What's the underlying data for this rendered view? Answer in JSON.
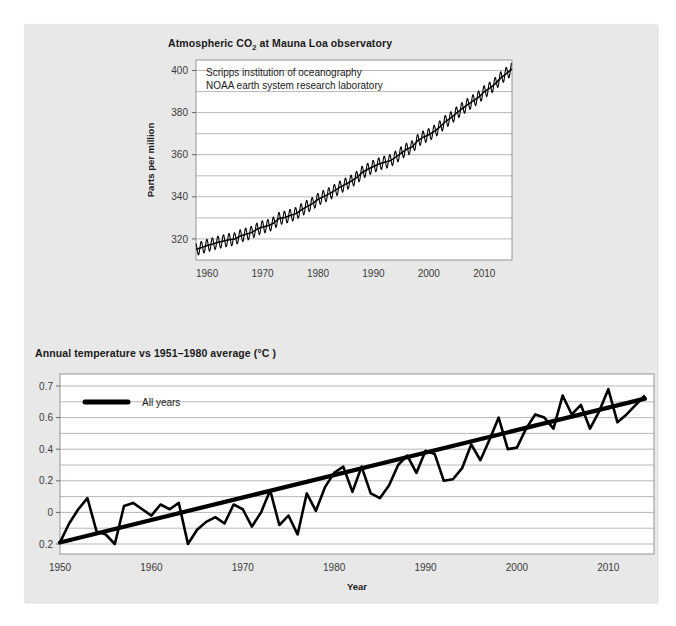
{
  "figure": {
    "background": "#e8e8e8",
    "panel_color": "#e8e8e8",
    "plot_color": "#ffffff",
    "line_color": "#000000",
    "grid_color": "#9a9a9a"
  },
  "chart_data": [
    {
      "id": "co2",
      "type": "line",
      "title": "Atmospheric CO₂ at Mauna Loa observatory",
      "title_plain": "Atmospheric CO2 at Mauna Loa observatory",
      "xlabel": "",
      "ylabel": "Parts per million",
      "annotations": [
        "Scripps institution of oceanography",
        "NOAA earth system research laboratory"
      ],
      "xlim": [
        1958,
        2015
      ],
      "ylim": [
        310,
        405
      ],
      "xticks": [
        1960,
        1970,
        1980,
        1990,
        2000,
        2010
      ],
      "xticklabels": [
        "1960",
        "1970",
        "1980",
        "1990",
        "2000",
        "2010"
      ],
      "yticks": [
        320,
        340,
        360,
        380,
        400
      ],
      "yticklabels": [
        "320",
        "340",
        "360",
        "380",
        "400"
      ],
      "minor_yticks": [
        330,
        350,
        370,
        390
      ],
      "grid": true,
      "legend": "none",
      "series": [
        {
          "name": "Monthly mean CO2",
          "note": "annual mean trend with seasonal sawtooth, amplitude about 3 ppm",
          "seasonal_amplitude_ppm": 3.0,
          "x": [
            1958,
            1959,
            1960,
            1961,
            1962,
            1963,
            1964,
            1965,
            1966,
            1967,
            1968,
            1969,
            1970,
            1971,
            1972,
            1973,
            1974,
            1975,
            1976,
            1977,
            1978,
            1979,
            1980,
            1981,
            1982,
            1983,
            1984,
            1985,
            1986,
            1987,
            1988,
            1989,
            1990,
            1991,
            1992,
            1993,
            1994,
            1995,
            1996,
            1997,
            1998,
            1999,
            2000,
            2001,
            2002,
            2003,
            2004,
            2005,
            2006,
            2007,
            2008,
            2009,
            2010,
            2011,
            2012,
            2013,
            2014,
            2015
          ],
          "values": [
            315.0,
            315.9,
            316.9,
            317.6,
            318.4,
            319.0,
            319.6,
            320.0,
            321.4,
            322.2,
            323.0,
            324.6,
            325.7,
            326.3,
            327.5,
            329.7,
            330.2,
            331.1,
            332.0,
            333.8,
            335.4,
            336.8,
            338.8,
            340.1,
            341.4,
            343.0,
            344.6,
            346.0,
            347.4,
            349.2,
            351.6,
            353.1,
            354.4,
            355.6,
            356.4,
            357.1,
            358.8,
            360.8,
            362.6,
            363.7,
            366.7,
            368.4,
            369.5,
            371.1,
            373.2,
            375.8,
            377.5,
            379.8,
            381.9,
            383.8,
            385.6,
            387.4,
            389.9,
            391.6,
            393.8,
            396.5,
            398.6,
            400.8
          ]
        }
      ]
    },
    {
      "id": "temperature",
      "type": "line",
      "title": "Annual temperature vs 1951–1980 average (°C )",
      "title_plain": "Annual temperature vs 1951-1980 average (C)",
      "xlabel": "Year",
      "ylabel": "",
      "xlim": [
        1950,
        2015
      ],
      "ylim": [
        -0.25,
        0.72
      ],
      "xticks": [
        1950,
        1960,
        1970,
        1980,
        1990,
        2000,
        2010
      ],
      "xticklabels": [
        "1950",
        "1960",
        "1970",
        "1980",
        "1990",
        "2000",
        "2010"
      ],
      "yticks": [
        0.7,
        0.6,
        0.4,
        0.2,
        0.0,
        -0.2
      ],
      "yticklabels": [
        "0.7",
        "0.6",
        "0.4",
        "0.2",
        "0",
        "0.2"
      ],
      "grid": true,
      "legend": {
        "position": "top-left",
        "entries": [
          {
            "label": "All years",
            "color": "#000000"
          }
        ]
      },
      "series": [
        {
          "name": "All years",
          "x": [
            1950,
            1951,
            1952,
            1953,
            1954,
            1955,
            1956,
            1957,
            1958,
            1959,
            1960,
            1961,
            1962,
            1963,
            1964,
            1965,
            1966,
            1967,
            1968,
            1969,
            1970,
            1971,
            1972,
            1973,
            1974,
            1975,
            1976,
            1977,
            1978,
            1979,
            1980,
            1981,
            1982,
            1983,
            1984,
            1985,
            1986,
            1987,
            1988,
            1989,
            1990,
            1991,
            1992,
            1993,
            1994,
            1995,
            1996,
            1997,
            1998,
            1999,
            2000,
            2001,
            2002,
            2003,
            2004,
            2005,
            2006,
            2007,
            2008,
            2009,
            2010,
            2011,
            2012,
            2013,
            2014
          ],
          "values": [
            -0.19,
            -0.07,
            0.02,
            0.09,
            -0.12,
            -0.14,
            -0.2,
            0.04,
            0.06,
            0.02,
            -0.02,
            0.05,
            0.02,
            0.06,
            -0.2,
            -0.11,
            -0.06,
            -0.03,
            -0.07,
            0.05,
            0.02,
            -0.09,
            0.0,
            0.14,
            -0.08,
            -0.02,
            -0.14,
            0.12,
            0.01,
            0.16,
            0.25,
            0.29,
            0.13,
            0.29,
            0.12,
            0.09,
            0.17,
            0.3,
            0.36,
            0.25,
            0.39,
            0.37,
            0.2,
            0.21,
            0.28,
            0.43,
            0.33,
            0.46,
            0.6,
            0.4,
            0.41,
            0.53,
            0.61,
            0.6,
            0.53,
            0.67,
            0.61,
            0.64,
            0.53,
            0.62,
            0.69,
            0.57,
            0.61,
            0.64,
            0.67
          ]
        },
        {
          "name": "Linear trend",
          "note": "straight fitted line drawn across all years",
          "x": [
            1950,
            2014
          ],
          "values": [
            -0.19,
            0.66
          ]
        }
      ]
    }
  ]
}
